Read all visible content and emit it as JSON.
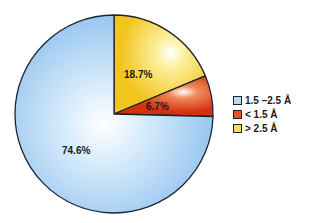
{
  "chart_data": {
    "type": "pie",
    "title": "",
    "categories": [
      "1.5 –2.5 Å",
      "< 1.5 Å",
      "> 2.5 Å"
    ],
    "values": [
      74.6,
      6.7,
      18.7
    ],
    "labels": [
      "74.6%",
      "6.7%",
      "18.7%"
    ],
    "colors": [
      "#a9cff2",
      "#d9401a",
      "#f7d23a"
    ],
    "start_angle_deg": 90,
    "direction": "clockwise",
    "slice_order_from_top": [
      "> 2.5 Å",
      "< 1.5 Å",
      "1.5 –2.5 Å"
    ],
    "legend_position": "right"
  },
  "legend": {
    "items": [
      {
        "label": "1.5 –2.5 Å",
        "color": "#a9cff2"
      },
      {
        "label": "< 1.5 Å",
        "color": "#d9401a"
      },
      {
        "label": "> 2.5 Å",
        "color": "#f7d23a"
      }
    ]
  },
  "slices": {
    "blue_label": "74.6%",
    "red_label": "6.7%",
    "yellow_label": "18.7%"
  }
}
